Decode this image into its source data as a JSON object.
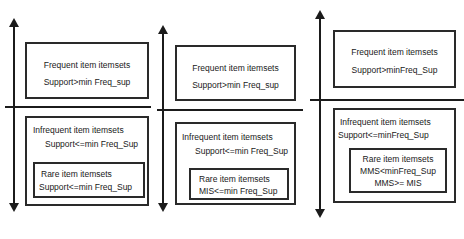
{
  "diagram": {
    "stroke_color": "#1b1b1b",
    "box_border_color": "#2a2a2a",
    "background_color": "#ffffff"
  },
  "panels": [
    {
      "id": "left",
      "axis_label": "support-axis",
      "frequent": {
        "line1": "Frequent item itemsets",
        "line2": "Support>min Freq_sup"
      },
      "infrequent": {
        "line1": "Infrequent  item itemsets",
        "line2": "Support<=min Freq_Sup"
      },
      "rare": {
        "line1": "Rare item itemsets",
        "line2": "Support<=min Freq_Sup"
      }
    },
    {
      "id": "middle",
      "axis_label": "support-axis",
      "frequent": {
        "line1": "Frequent item itemsets",
        "line2": "Support>min Freq_sup"
      },
      "infrequent": {
        "line1": "Infrequent  item itemsets",
        "line2": "Support<=min Freq_Sup"
      },
      "rare": {
        "line1": "Rare item itemsets",
        "line2": "MIS<=min Freq_Sup"
      }
    },
    {
      "id": "right",
      "axis_label": "support-axis",
      "frequent": {
        "line1": "Frequent item itemsets",
        "line2": "Support>minFreq_Sup"
      },
      "infrequent": {
        "line1": "Infrequent  item itemsets",
        "line2": "Support<=minFreq_Sup"
      },
      "rare": {
        "line1": "Rare item itemsets",
        "line2": "MMS<minFreq_Sup",
        "line3": "MMS>= MIS"
      }
    }
  ]
}
